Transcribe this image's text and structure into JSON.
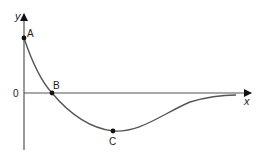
{
  "diagram": {
    "type": "function-graph",
    "axes": {
      "x_label": "x",
      "y_label": "y",
      "origin_label": "0"
    },
    "points": [
      {
        "label": "A",
        "description": "y-intercept",
        "px": [
          24,
          38
        ]
      },
      {
        "label": "B",
        "description": "x-intercept",
        "px": [
          52,
          93
        ]
      },
      {
        "label": "C",
        "description": "minimum point",
        "px": [
          113,
          131
        ]
      }
    ],
    "curve": {
      "description": "decreasing from A through B to minimum C, then rising asymptotically toward the x-axis",
      "color": "#555555"
    },
    "colors": {
      "axis": "#555555",
      "point": "#111111"
    }
  }
}
